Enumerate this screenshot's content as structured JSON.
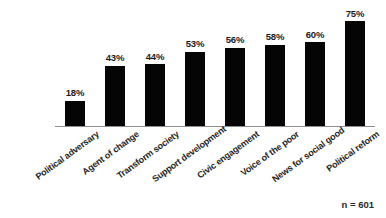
{
  "chart_data": {
    "type": "bar",
    "title": "",
    "subtitle": "",
    "xlabel": "",
    "ylabel": "",
    "ylim": [
      0,
      80
    ],
    "grid": false,
    "legend": false,
    "orientation": "vertical",
    "bar_color": "#050505",
    "axis_color": "#8d8d8d",
    "background": "#ffffff",
    "categories": [
      "Political adversary",
      "Agent of change",
      "Transform society",
      "Support development",
      "Civic engagement",
      "Voice of the poor",
      "News for social good",
      "Political reform"
    ],
    "values": [
      18,
      43,
      44,
      53,
      56,
      58,
      60,
      75
    ],
    "value_labels": [
      "18%",
      "43%",
      "44%",
      "53%",
      "56%",
      "58%",
      "60%",
      "75%"
    ],
    "annotations": [
      {
        "text": "n = 601",
        "position": "bottom-right"
      }
    ]
  },
  "footnote": {
    "sample_size_label": "n = 601"
  }
}
